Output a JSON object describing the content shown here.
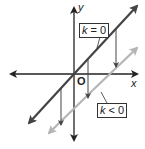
{
  "axes": {
    "x_label": "x",
    "y_label": "y",
    "origin_label": "O"
  },
  "lines": [
    {
      "name": "k = 0",
      "label_var": "k",
      "label_rest": " = 0",
      "color": "#444444"
    },
    {
      "name": "k < 0",
      "label_var": "k",
      "label_rest": " < 0",
      "color": "#b5b5b5"
    }
  ],
  "colors": {
    "axis": "#222222",
    "shift_arrows": "#444444"
  }
}
